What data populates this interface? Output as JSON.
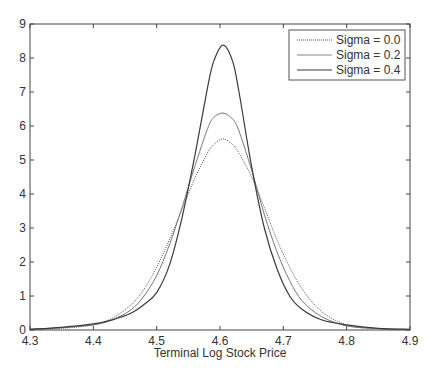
{
  "chart_data": {
    "type": "line",
    "title": "",
    "xlabel": "Terminal Log Stock Price",
    "ylabel": "",
    "xlim": [
      4.3,
      4.9
    ],
    "ylim": [
      0,
      9
    ],
    "xticks": [
      4.3,
      4.4,
      4.5,
      4.6,
      4.7,
      4.8,
      4.9
    ],
    "xtick_labels": [
      "4.3",
      "4.4",
      "4.5",
      "4.6",
      "4.7",
      "4.8",
      "4.9"
    ],
    "yticks": [
      0,
      1,
      2,
      3,
      4,
      5,
      6,
      7,
      8,
      9
    ],
    "ytick_labels": [
      "0",
      "1",
      "2",
      "3",
      "4",
      "5",
      "6",
      "7",
      "8",
      "9"
    ],
    "grid": false,
    "legend_position": "upper right",
    "x": [
      4.3,
      4.35,
      4.4,
      4.43,
      4.46,
      4.48,
      4.5,
      4.52,
      4.54,
      4.56,
      4.58,
      4.59,
      4.605,
      4.62,
      4.63,
      4.65,
      4.67,
      4.69,
      4.71,
      4.73,
      4.76,
      4.8,
      4.85,
      4.9
    ],
    "series": [
      {
        "name": "Sigma = 0.0",
        "style": "dotted",
        "values": [
          0.01,
          0.05,
          0.15,
          0.35,
          0.75,
          1.2,
          1.85,
          2.65,
          3.55,
          4.45,
          5.2,
          5.45,
          5.62,
          5.45,
          5.2,
          4.5,
          3.6,
          2.65,
          1.85,
          1.2,
          0.55,
          0.15,
          0.04,
          0.01
        ]
      },
      {
        "name": "Sigma = 0.2",
        "style": "solid-light",
        "values": [
          0.02,
          0.07,
          0.15,
          0.3,
          0.6,
          1.0,
          1.6,
          2.5,
          3.6,
          4.8,
          5.9,
          6.25,
          6.38,
          6.2,
          5.85,
          4.7,
          3.4,
          2.3,
          1.45,
          0.85,
          0.4,
          0.12,
          0.04,
          0.01
        ]
      },
      {
        "name": "Sigma = 0.4",
        "style": "solid-dark",
        "values": [
          0.02,
          0.08,
          0.18,
          0.3,
          0.5,
          0.75,
          1.1,
          1.9,
          3.3,
          5.1,
          7.1,
          7.9,
          8.38,
          7.9,
          7.0,
          4.8,
          3.0,
          1.8,
          1.0,
          0.6,
          0.3,
          0.15,
          0.05,
          0.02
        ]
      }
    ]
  },
  "legend": {
    "items": [
      {
        "label": "Sigma = 0.0",
        "style": "dotted"
      },
      {
        "label": "Sigma = 0.2",
        "style": "solid-light"
      },
      {
        "label": "Sigma = 0.4",
        "style": "solid-dark"
      }
    ]
  },
  "colors": {
    "axis": "#444444",
    "text": "#333333",
    "series_dotted": "#555555",
    "series_light": "#777777",
    "series_dark": "#3a3a3a",
    "background": "#ffffff"
  }
}
